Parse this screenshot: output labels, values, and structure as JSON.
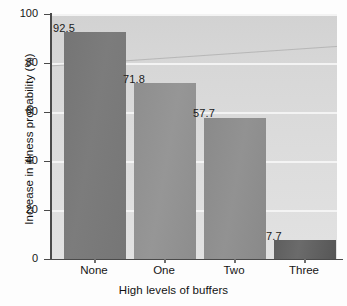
{
  "chart_data": {
    "type": "bar",
    "title": "",
    "xlabel": "High levels of buffers",
    "ylabel": "Increase in illness probability (%)",
    "categories": [
      "None",
      "One",
      "Two",
      "Three"
    ],
    "values": [
      92.5,
      71.8,
      57.7,
      7.7
    ],
    "value_labels": [
      "92.5",
      "71.8",
      "57.7",
      "7.7"
    ],
    "ylim": [
      0,
      100
    ],
    "yticks": [
      0,
      20,
      40,
      60,
      80,
      100
    ],
    "ytick_labels": [
      "0",
      "20",
      "40",
      "60",
      "80",
      "100"
    ],
    "grid": true,
    "grid_axis": "y",
    "legend": false,
    "bar_colors": [
      "#7a7a7a",
      "#939393",
      "#8f8f8f",
      "#636363"
    ],
    "panel_color": "#d9d9d9",
    "gridline_color": "#f4f4f4",
    "axis_color": "#4a4a4a",
    "text_color": "#151515"
  }
}
